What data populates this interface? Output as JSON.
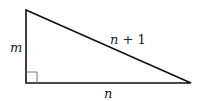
{
  "diagram": {
    "type": "right-triangle",
    "labels": {
      "vertical_leg": "m",
      "hypotenuse_var": "n",
      "hypotenuse_rest": " + 1",
      "horizontal_leg": "n"
    },
    "colors": {
      "stroke": "#111111",
      "angle_marker": "#555555"
    }
  }
}
